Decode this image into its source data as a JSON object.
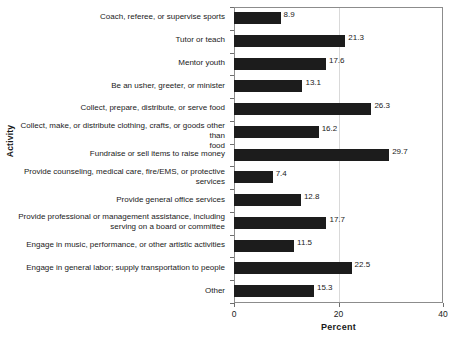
{
  "chart_data": {
    "type": "bar",
    "orientation": "horizontal",
    "title": "",
    "xlabel": "Percent",
    "ylabel": "Activity",
    "xlim": [
      0,
      40
    ],
    "xticks": [
      0,
      20,
      40
    ],
    "xtick_labels": [
      "0",
      "20",
      "40"
    ],
    "grid": "vertical-at-20",
    "legend": "none",
    "bar_color": "#1c1c1c",
    "categories": [
      "Coach, referee, or supervise sports",
      "Tutor or teach",
      "Mentor youth",
      "Be an usher, greeter, or minister",
      "Collect, prepare, distribute, or serve food",
      "Collect, make, or distribute clothing, crafts, or goods other than food",
      "Fundraise or sell items to raise money",
      "Provide counseling, medical care, fire/EMS, or protective services",
      "Provide general office services",
      "Provide professional or management assistance, including serving on a board or committee",
      "Engage in music, performance, or other artistic activities",
      "Engage in general labor; supply transportation to people",
      "Other"
    ],
    "category_lines": [
      [
        "Coach, referee, or supervise sports"
      ],
      [
        "Tutor or teach"
      ],
      [
        "Mentor youth"
      ],
      [
        "Be an usher, greeter, or minister"
      ],
      [
        "Collect, prepare, distribute, or serve food"
      ],
      [
        "Collect, make, or distribute clothing, crafts, or goods other than",
        "food"
      ],
      [
        "Fundraise or sell items to raise money"
      ],
      [
        "Provide counseling, medical care, fire/EMS, or protective",
        "services"
      ],
      [
        "Provide general office services"
      ],
      [
        "Provide professional or management assistance, including",
        "serving on a board or committee"
      ],
      [
        "Engage in music, performance, or other artistic activities"
      ],
      [
        "Engage in general labor; supply transportation to people"
      ],
      [
        "Other"
      ]
    ],
    "values": [
      8.9,
      21.3,
      17.6,
      13.1,
      26.3,
      16.2,
      29.7,
      7.4,
      12.8,
      17.7,
      11.5,
      22.5,
      15.3
    ],
    "value_labels": [
      "8.9",
      "21.3",
      "17.6",
      "13.1",
      "26.3",
      "16.2",
      "29.7",
      "7.4",
      "12.8",
      "17.7",
      "11.5",
      "22.5",
      "15.3"
    ]
  }
}
